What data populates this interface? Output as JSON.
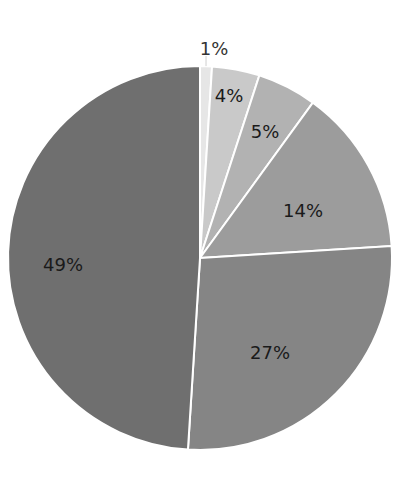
{
  "chart_data": {
    "type": "pie",
    "title": "",
    "start_angle_deg": 0,
    "direction": "clockwise",
    "categories": [
      "Slice 1",
      "Slice 2",
      "Slice 3",
      "Slice 4",
      "Slice 5",
      "Slice 6"
    ],
    "values": [
      1,
      4,
      5,
      14,
      27,
      49
    ],
    "labels": [
      "1%",
      "4%",
      "5%",
      "14%",
      "27%",
      "49%"
    ],
    "colors": [
      "#e6e6e6",
      "#c9c9c9",
      "#b2b2b2",
      "#9c9c9c",
      "#858585",
      "#6f6f6f"
    ],
    "legend": null,
    "label_positions": [
      {
        "x": 214,
        "y": 50,
        "outside": true
      },
      {
        "x": 229,
        "y": 97
      },
      {
        "x": 265,
        "y": 133
      },
      {
        "x": 303,
        "y": 212
      },
      {
        "x": 270,
        "y": 354
      },
      {
        "x": 63,
        "y": 266
      }
    ]
  },
  "geometry": {
    "cx": 200,
    "cy": 258,
    "r": 192
  }
}
